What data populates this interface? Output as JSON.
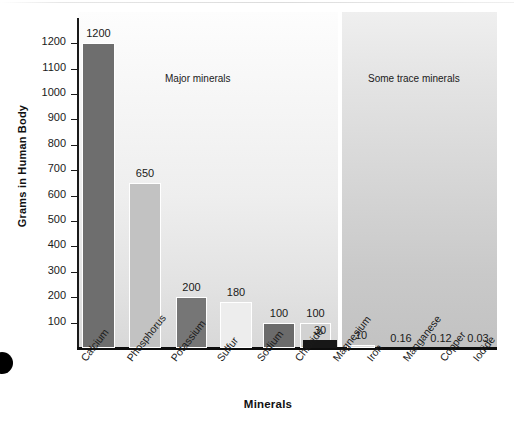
{
  "chart_data": {
    "type": "bar",
    "title": "",
    "xlabel": "Minerals",
    "ylabel": "Grams in Human Body",
    "ylim": [
      0,
      1250
    ],
    "grid": false,
    "legend": "none",
    "yticks": [
      100,
      200,
      300,
      400,
      500,
      600,
      700,
      800,
      900,
      1000,
      1100,
      1200
    ],
    "ytick_labels": [
      "100",
      "200",
      "300",
      "400",
      "500",
      "600",
      "700",
      "800",
      "900",
      "1000",
      "1100",
      "1200"
    ],
    "panels": [
      {
        "name": "major",
        "label": "Major minerals"
      },
      {
        "name": "trace",
        "label": "Some trace minerals"
      }
    ],
    "categories": [
      "Calcium",
      "Phosphorus",
      "Potassium",
      "Sulfur",
      "Sodium",
      "Chloride",
      "Magnesium",
      "Iron",
      "Manganese",
      "Copper",
      "Iodide"
    ],
    "values": [
      1200,
      650,
      200,
      180,
      100,
      100,
      30,
      10,
      0.16,
      0.12,
      0.03
    ],
    "value_labels": [
      "1200",
      "650",
      "200",
      "180",
      "100",
      "100",
      "30",
      "10",
      "0.16",
      "0.12",
      "0.03"
    ],
    "bars": [
      {
        "category": "Calcium",
        "value": 1200,
        "label": "1200",
        "panel": "major",
        "color": "#6e6e6e"
      },
      {
        "category": "Phosphorus",
        "value": 650,
        "label": "650",
        "panel": "major",
        "color": "#c2c2c2"
      },
      {
        "category": "Potassium",
        "value": 200,
        "label": "200",
        "panel": "major",
        "color": "#767676"
      },
      {
        "category": "Sulfur",
        "value": 180,
        "label": "180",
        "panel": "major",
        "color": "#ededed"
      },
      {
        "category": "Sodium",
        "value": 100,
        "label": "100",
        "panel": "major",
        "color": "#6b6b6b"
      },
      {
        "category": "Chloride",
        "value": 100,
        "label": "100",
        "panel": "major",
        "color": "#d2d2d2"
      },
      {
        "category": "Magnesium",
        "value": 30,
        "label": "30",
        "panel": "major",
        "color": "#171717"
      },
      {
        "category": "Iron",
        "value": 10,
        "label": "10",
        "panel": "trace",
        "color": "#dcdcdc"
      },
      {
        "category": "Manganese",
        "value": 0.16,
        "label": "0.16",
        "panel": "trace",
        "color": "#c8c8c8"
      },
      {
        "category": "Copper",
        "value": 0.12,
        "label": "0.12",
        "panel": "trace",
        "color": "#c8c8c8"
      },
      {
        "category": "Iodide",
        "value": 0.03,
        "label": "0.03",
        "panel": "trace",
        "color": "#c8c8c8"
      }
    ],
    "colors": {
      "bar_dark": "#6e6e6e",
      "bar_light": "#d2d2d2",
      "bar_black": "#171717",
      "axis": "#1a1a1a",
      "panel_major_bg": "#f0f0f0",
      "panel_trace_bg": "#d6d6d6",
      "text": "#1a1a1a",
      "background": "#ffffff"
    }
  }
}
